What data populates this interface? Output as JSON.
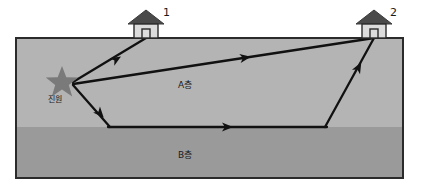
{
  "diagram": {
    "colors": {
      "background": "#ffffff",
      "layer_a_fill": "#b4b4b4",
      "layer_b_fill": "#9a9a9a",
      "box_border": "#2b2b2b",
      "ray_stroke": "#111111",
      "star_fill": "#7a7a7a",
      "house_roof": "#4a4a4a",
      "house_body": "#dcdcdc",
      "house_outline": "#2b2b2b",
      "text": "#1a1a1a"
    },
    "layers": [
      {
        "id": "A",
        "label": "A층",
        "label_x": 178,
        "label_y": 78
      },
      {
        "id": "B",
        "label": "B층",
        "label_x": 178,
        "label_y": 148
      }
    ],
    "source": {
      "icon": "star-icon",
      "label": "진원",
      "x": 62,
      "y": 82
    },
    "stations": [
      {
        "id": "1",
        "label": "1",
        "icon": "house-icon",
        "x": 146,
        "y": 22
      },
      {
        "id": "2",
        "label": "2",
        "icon": "house-icon",
        "x": 374,
        "y": 22
      }
    ],
    "geometry": {
      "box_left": 16,
      "box_right": 403,
      "surface_y": 38,
      "interface_y": 127,
      "box_bottom": 178
    },
    "ray_paths": [
      {
        "name": "direct-ray-to-station-1",
        "points": "73,82 146,38",
        "arrow_at": "0.52",
        "description": "direct upward wave from focus to station 1"
      },
      {
        "name": "direct-ray-to-station-2",
        "points": "73,84 374,38",
        "arrow_at": "0.58",
        "description": "direct wave from focus to station 2"
      },
      {
        "name": "refracted-ray-downgoing",
        "points": "73,85 110,127",
        "arrow_at": "0.55",
        "description": "downgoing segment from focus to A/B interface"
      },
      {
        "name": "refracted-ray-head-wave",
        "points": "110,127 325,127",
        "arrow_at": "0.52",
        "description": "head wave refracted along the A/B interface"
      },
      {
        "name": "refracted-ray-upgoing",
        "points": "325,127 374,38",
        "arrow_at": "0.62",
        "description": "upgoing segment from interface to station 2"
      }
    ]
  }
}
